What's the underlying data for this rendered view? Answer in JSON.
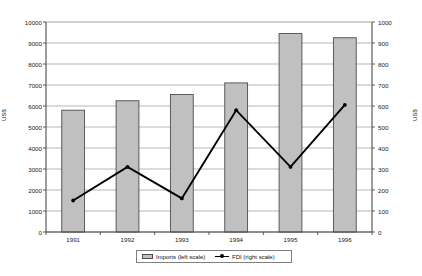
{
  "chart_data": {
    "type": "bar",
    "title": "",
    "xlabel": "",
    "ylabel": "US$",
    "y2label": "US$",
    "categories": [
      "1991",
      "1992",
      "1993",
      "1994",
      "1995",
      "1996"
    ],
    "series": [
      {
        "name": "Imports (left scale)",
        "type": "bar",
        "axis": "left",
        "color": "#c0c0c0",
        "values": [
          5800,
          6250,
          6550,
          7100,
          9450,
          9250
        ]
      },
      {
        "name": "FDI (right scale)",
        "type": "line",
        "axis": "right",
        "color": "#000000",
        "values": [
          150,
          310,
          160,
          580,
          310,
          605
        ]
      }
    ],
    "ylim": [
      0,
      10000
    ],
    "y2lim": [
      0,
      1000
    ],
    "yticks": [
      "10000",
      "9000",
      "8000",
      "7000",
      "6000",
      "5000",
      "4000",
      "3000",
      "2000",
      "1000",
      "0"
    ],
    "y2ticks": [
      "1000",
      "900",
      "800",
      "700",
      "600",
      "500",
      "400",
      "300",
      "200",
      "100",
      "0"
    ],
    "grid": true,
    "legend_position": "bottom"
  },
  "legend": {
    "imports_label": "Imports (left scale)",
    "fdi_label": "FDI (right scale)"
  },
  "colors": {
    "bar_fill": "#c0c0c0",
    "bar_stroke": "#4d4d4d",
    "line": "#000000",
    "grid": "#999999",
    "axis": "#4d4d4d"
  }
}
